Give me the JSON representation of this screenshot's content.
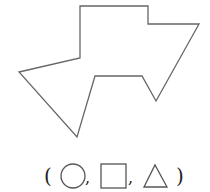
{
  "figure": {
    "polygon_points": "80,6 148,6 148,24 199,24 156,101 142,76 95,76 77,137 19,72 80,58",
    "stroke": "#666666"
  },
  "answer_row": {
    "open_paren": "(",
    "close_paren": ")",
    "separator": ",",
    "options": [
      "circle",
      "square",
      "triangle"
    ]
  }
}
